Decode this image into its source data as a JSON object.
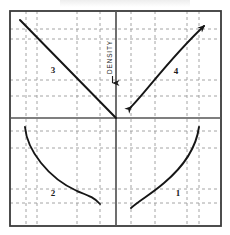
{
  "figure": {
    "kind": "four-quadrant-nomograph",
    "frame": {
      "x": 10,
      "y": 11,
      "width": 211,
      "height": 215
    },
    "origin": {
      "x": 116,
      "y": 118
    },
    "colors": {
      "ink": "#1c1c1c",
      "frame": "#3a3a3a",
      "axis": "#555555",
      "gridline": "#9a9a9a",
      "curve": "#161616",
      "background": "#ffffff"
    },
    "axis_caption": {
      "text": "DENSITY",
      "orientation": "vertical-bottom-to-top",
      "arrow_direction": "down",
      "x": 112,
      "text_bottom_y": 74,
      "arrow_top_y": 76,
      "arrow_tip_y": 90
    },
    "quadrant_labels": [
      {
        "id": "q3",
        "text": "3",
        "x": 53,
        "y": 73,
        "position": "upper-left"
      },
      {
        "id": "q4",
        "text": "4",
        "x": 176,
        "y": 74,
        "position": "upper-right"
      },
      {
        "id": "q2",
        "text": "2",
        "x": 53,
        "y": 196,
        "position": "lower-left"
      },
      {
        "id": "q1",
        "text": "1",
        "x": 178,
        "y": 196,
        "position": "lower-right"
      }
    ],
    "gridlines": {
      "style": "dashed",
      "dash_pattern": "3,3",
      "vertical_x": [
        26,
        37,
        77,
        100,
        131,
        155,
        187,
        199
      ],
      "horizontal_y": [
        29,
        39,
        80,
        96,
        131,
        148,
        189,
        203
      ]
    },
    "curves": [
      {
        "id": "curve-q3",
        "quadrant": 3,
        "shape": "straight-diagonal",
        "description": "straight line descending from upper-left frame corner to origin",
        "path": "M 20 20 L 116 118"
      },
      {
        "id": "curve-q4",
        "quadrant": 4,
        "shape": "concave-ascending-arrowed",
        "description": "gently curved ascending line with arrowheads at both ends",
        "path": "M 131 107 C 146 92, 170 58, 204 26",
        "arrow_start": true,
        "arrow_end": true
      },
      {
        "id": "curve-q2",
        "quadrant": 2,
        "shape": "convex-descending",
        "description": "convex curve falling steeply from upper-left then flattening to lower-right",
        "path": "M 25 127 C 27 150, 48 178, 77 191 C 87 195, 94 197, 100 204"
      },
      {
        "id": "curve-q1",
        "quadrant": 1,
        "shape": "concave-ascending",
        "description": "concave curve rising slowly then steeply from lower-left to upper-right",
        "path": "M 131 208 C 140 200, 150 195, 164 183 C 183 167, 196 149, 199 127"
      }
    ]
  }
}
